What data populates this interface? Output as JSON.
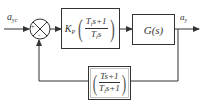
{
  "diagram": {
    "type": "feedback-control-block-diagram",
    "input": {
      "symbol": "a",
      "subscript": "yc"
    },
    "output": {
      "symbol": "a",
      "subscript": "y"
    },
    "summing_junction": {
      "signs": [
        "+",
        "-"
      ]
    },
    "controller": {
      "gain": "K",
      "gain_subscript": "P",
      "numerator": {
        "t": "T",
        "t_sub": "i",
        "rest": "s+1"
      },
      "denominator": {
        "t": "T",
        "t_sub": "i",
        "rest": "s"
      }
    },
    "plant": {
      "label": "G(s)"
    },
    "feedback": {
      "numerator": {
        "text": "Ts+1"
      },
      "denominator": {
        "t": "T",
        "t_sub": "i",
        "rest": "s+1"
      }
    },
    "colors": {
      "line": "#333333",
      "background": "#ffffff"
    }
  }
}
